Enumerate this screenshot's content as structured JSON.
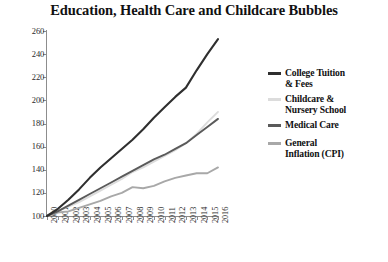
{
  "chart_data": {
    "type": "line",
    "title": "Education, Health Care and Childcare Bubbles",
    "xlabel": "",
    "ylabel": "100=2000",
    "ylim": [
      100,
      260
    ],
    "yticks": [
      100,
      120,
      140,
      160,
      180,
      200,
      220,
      240,
      260
    ],
    "xlim": [
      2000,
      2016
    ],
    "x": [
      2000,
      2001,
      2002,
      2003,
      2004,
      2005,
      2006,
      2007,
      2008,
      2009,
      2010,
      2011,
      2012,
      2013,
      2014,
      2015,
      2016
    ],
    "categories": [
      "2000",
      "2001",
      "2002",
      "2003",
      "2004",
      "2005",
      "2006",
      "2007",
      "2008",
      "2009",
      "2010",
      "2011",
      "2012",
      "2013",
      "2014",
      "2015",
      "2016"
    ],
    "grid": false,
    "legend_position": "right",
    "series": [
      {
        "name": "College Tuition & Fees",
        "label": "College Tuition\n& Fees",
        "color": "#2f2f2f",
        "values": [
          100,
          106,
          114,
          123,
          133,
          142,
          150,
          158,
          166,
          175,
          185,
          194,
          203,
          211,
          226,
          240,
          253
        ]
      },
      {
        "name": "Childcare & Nursery School",
        "label": "Childcare &\nNursery School",
        "color": "#dcdcdc",
        "values": [
          100,
          104,
          108,
          112,
          117,
          122,
          127,
          132,
          138,
          142,
          147,
          152,
          157,
          163,
          171,
          181,
          190
        ]
      },
      {
        "name": "Medical Care",
        "label": "Medical Care",
        "color": "#5a5a5a",
        "values": [
          100,
          104,
          109,
          114,
          119,
          124,
          129,
          134,
          139,
          144,
          149,
          153,
          158,
          163,
          170,
          177,
          184
        ]
      },
      {
        "name": "General Inflation (CPI)",
        "label": "General\nInflation (CPI)",
        "color": "#a8a8a8",
        "values": [
          100,
          103,
          104,
          107,
          110,
          113,
          117,
          120,
          125,
          124,
          126,
          130,
          133,
          135,
          137,
          137,
          142
        ]
      }
    ]
  },
  "axis": {
    "y_title": "100=2000"
  }
}
